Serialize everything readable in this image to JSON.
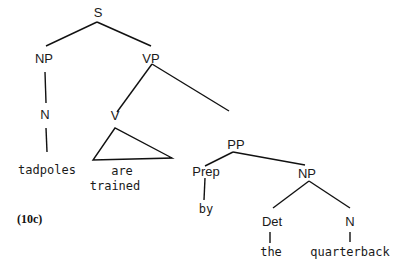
{
  "figure_label": "(10c)",
  "tree": {
    "nodes": {
      "S": "S",
      "NP1": "NP",
      "VP": "VP",
      "N1": "N",
      "V": "V",
      "PP": "PP",
      "Prep": "Prep",
      "NP2": "NP",
      "Det": "Det",
      "N2": "N"
    },
    "words": {
      "tadpoles": "tadpoles",
      "are": "are",
      "trained": "trained",
      "by": "by",
      "the": "the",
      "quarterback": "quarterback"
    }
  }
}
